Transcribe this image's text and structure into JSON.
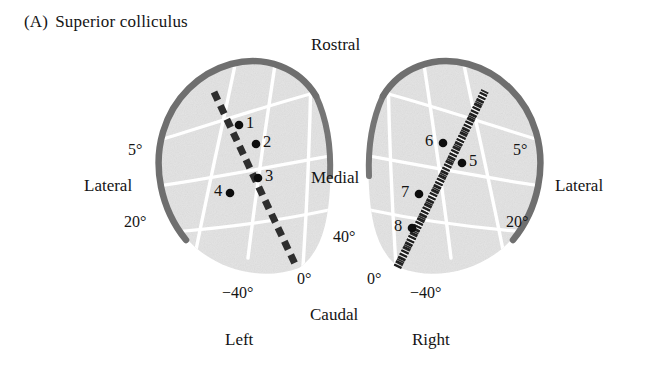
{
  "figure": {
    "panel_letter": "(A)",
    "title": "Superior colliculus",
    "colors": {
      "colliculus_fill": "#e3e3e3",
      "colliculus_border": "#6f6f6f",
      "grid_line": "#ffffff",
      "track_dark": "#2b2b2b",
      "text": "#141414"
    }
  },
  "orientation_labels": {
    "rostral": "Rostral",
    "caudal": "Caudal",
    "medial": "Medial",
    "lateral_left": "Lateral",
    "lateral_right": "Lateral",
    "left_hemisphere": "Left",
    "right_hemisphere": "Right"
  },
  "axis_labels": {
    "left": [
      {
        "text": "5°",
        "x": 128,
        "y": 142
      },
      {
        "text": "20°",
        "x": 124,
        "y": 214
      },
      {
        "text": "0°",
        "x": 297,
        "y": 271
      },
      {
        "text": "−40°",
        "x": 222,
        "y": 285
      }
    ],
    "right": [
      {
        "text": "5°",
        "x": 513,
        "y": 142
      },
      {
        "text": "20°",
        "x": 506,
        "y": 214
      },
      {
        "text": "0°",
        "x": 367,
        "y": 271
      },
      {
        "text": "−40°",
        "x": 410,
        "y": 285
      },
      {
        "text": "40°",
        "x": 333,
        "y": 229
      }
    ]
  },
  "recording_sites": {
    "left_hemisphere": [
      {
        "id": "1",
        "x": 239,
        "y": 125,
        "label_side": "right"
      },
      {
        "id": "2",
        "x": 256,
        "y": 144,
        "label_side": "right"
      },
      {
        "id": "3",
        "x": 258,
        "y": 178,
        "label_side": "right"
      },
      {
        "id": "4",
        "x": 230,
        "y": 193,
        "label_side": "left"
      }
    ],
    "right_hemisphere": [
      {
        "id": "5",
        "x": 462,
        "y": 163,
        "label_side": "right"
      },
      {
        "id": "6",
        "x": 443,
        "y": 143,
        "label_side": "left"
      },
      {
        "id": "7",
        "x": 419,
        "y": 194,
        "label_side": "left"
      },
      {
        "id": "8",
        "x": 412,
        "y": 228,
        "label_side": "left"
      }
    ]
  },
  "electrode_tracks": {
    "left": {
      "style": "dashed",
      "x1": 214,
      "y1": 92,
      "x2": 296,
      "y2": 266
    },
    "right": {
      "style": "hatched",
      "x1": 485,
      "y1": 91,
      "x2": 397,
      "y2": 268
    }
  }
}
